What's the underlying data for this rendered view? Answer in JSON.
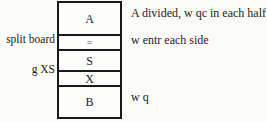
{
  "stack": {
    "cells": [
      "A",
      "=",
      "S",
      "X",
      "B"
    ]
  },
  "left_labels": [
    "split board",
    "g XS"
  ],
  "right_labels": [
    "A divided, w qc in each half",
    "w entr each side",
    "w q"
  ],
  "colors": {
    "background": "#fbfbf8",
    "box_fill": "#fdfdfb",
    "border": "#1a1a1a",
    "text": "#1c1c1c",
    "equals_symbol": "#8a8a8a"
  }
}
